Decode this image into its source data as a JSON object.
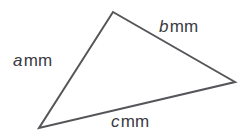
{
  "figure": {
    "background_color": "#ffffff",
    "stroke_color": "#55555a",
    "text_color": "#3a3a3f",
    "stroke_width": 2,
    "width": 243,
    "height": 132
  },
  "shape": {
    "name": "triangle",
    "vertices": [
      {
        "name": "apex",
        "x": 113,
        "y": 12
      },
      {
        "name": "right",
        "x": 235,
        "y": 82
      },
      {
        "name": "bottom-left",
        "x": 39,
        "y": 128
      }
    ],
    "points_attr": "113,12 235,82 39,128"
  },
  "labels": {
    "a": {
      "symbol": "a",
      "unit": "mm",
      "full": "a mm"
    },
    "b": {
      "symbol": "b",
      "unit": "mm",
      "full": "b mm"
    },
    "c": {
      "symbol": "c",
      "unit": "mm",
      "full": "c mm"
    }
  }
}
